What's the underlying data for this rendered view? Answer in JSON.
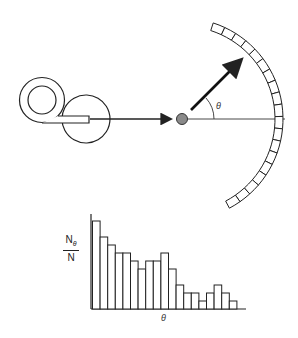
{
  "diagram": {
    "title": "",
    "source_label": "",
    "angle_symbol": "θ",
    "colors": {
      "stroke": "#222222",
      "target": "#8a8a8a",
      "background": "#ffffff"
    },
    "components": [
      {
        "id": "source-coil",
        "description": "coiled source / beam tube"
      },
      {
        "id": "incident-beam-arrow",
        "description": "incoming particle arrow"
      },
      {
        "id": "target",
        "description": "gray scattering target"
      },
      {
        "id": "scattered-arrow",
        "description": "scattered particle arrow at angle theta"
      },
      {
        "id": "reference-axis",
        "description": "horizontal reference line"
      },
      {
        "id": "detector-arc",
        "description": "segmented detector arc",
        "segments": 19
      }
    ]
  },
  "chart_data": {
    "type": "bar",
    "title": "",
    "xlabel": "θ",
    "ylabel": "Nθ / N",
    "ylabel_numerator": "N",
    "ylabel_numerator_sub": "θ",
    "ylabel_denominator": "N",
    "categories": [
      "1",
      "2",
      "3",
      "4",
      "5",
      "6",
      "7",
      "8",
      "9",
      "10",
      "11",
      "12",
      "13",
      "14",
      "15",
      "16",
      "17",
      "18",
      "19"
    ],
    "values": [
      11,
      9,
      8,
      7,
      7,
      6,
      5,
      6,
      6,
      7,
      5,
      3,
      2,
      2,
      1,
      2,
      3,
      2,
      1
    ],
    "ylim": [
      0,
      12
    ],
    "grid": false,
    "legend": "none",
    "tick_labels": false
  }
}
